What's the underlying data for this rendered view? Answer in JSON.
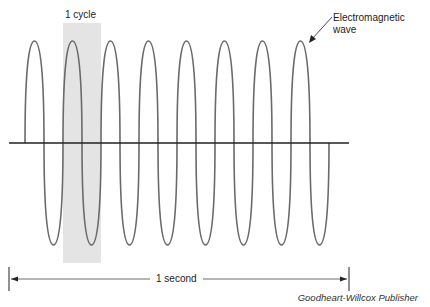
{
  "diagram": {
    "cycle_label": "1 cycle",
    "wave_label_line1": "Electromagnetic",
    "wave_label_line2": "wave",
    "duration_label": "1 second",
    "credit": "Goodheart-Willcox Publisher",
    "cycles_per_second": 8,
    "highlighted_cycle_index": 2,
    "colors": {
      "wave": "#6a6a6a",
      "axis": "#222222",
      "highlight": "#e4e4e4",
      "text": "#222222"
    }
  }
}
